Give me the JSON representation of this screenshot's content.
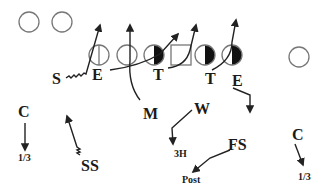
{
  "diagram": {
    "offense": {
      "backs": [
        {
          "name": "back-1"
        },
        {
          "name": "back-2"
        }
      ],
      "line": [
        "split-end",
        "tackle",
        "guard",
        "center",
        "guard",
        "tackle"
      ],
      "receiver": "wide-receiver"
    },
    "defense": {
      "labels": {
        "s": "S",
        "e_left": "E",
        "t_left": "T",
        "t_right": "T",
        "e_right": "E",
        "m": "M",
        "w": "W",
        "c_left": "C",
        "ss": "SS",
        "fs": "FS",
        "c_right": "C"
      },
      "assignments": {
        "c_left": "1/3",
        "w": "3H",
        "fs": "Post",
        "c_right": "1/3"
      }
    },
    "colors": {
      "player_outline": "#777777",
      "filled_half": "#111111",
      "route_line": "#222222",
      "label_text": "#1a1a1a"
    }
  }
}
